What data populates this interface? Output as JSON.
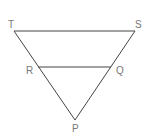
{
  "diagram": {
    "type": "geometry",
    "points": {
      "T": {
        "label": "T",
        "x": 14,
        "y": 31
      },
      "S": {
        "label": "S",
        "x": 135,
        "y": 31
      },
      "R": {
        "label": "R",
        "x": 38,
        "y": 67
      },
      "Q": {
        "label": "Q",
        "x": 111,
        "y": 67
      },
      "P": {
        "label": "P",
        "x": 75,
        "y": 120
      }
    },
    "segments": [
      "TS",
      "TP",
      "SP",
      "RQ"
    ],
    "colors": {
      "line": "#444444",
      "label": "#777777"
    }
  }
}
